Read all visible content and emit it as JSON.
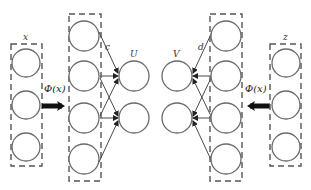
{
  "diagram": {
    "left": {
      "input_label": "x",
      "input_nodes": 3,
      "mapping_label": "Φ(x)",
      "hidden_nodes": 4,
      "weight_label": "c",
      "output_label": "U",
      "output_nodes": 2
    },
    "right": {
      "input_label": "z",
      "input_nodes": 3,
      "mapping_label": "Φ(x)",
      "hidden_nodes": 4,
      "weight_label": "d",
      "output_label": "V",
      "output_nodes": 2
    },
    "colors": {
      "node_stroke": "#6a6a6a",
      "box_stroke": "#555555",
      "edge": "#4a4a4a",
      "big_arrow": "#111111",
      "background": "#ffffff"
    }
  }
}
